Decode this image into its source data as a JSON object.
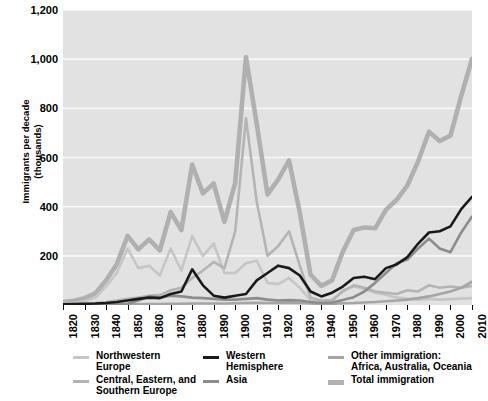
{
  "chart_data": {
    "type": "line",
    "title": "",
    "xlabel": "",
    "ylabel": "Immigrants per decade\n(thousands)",
    "xlim": [
      1820,
      2010
    ],
    "ylim": [
      0,
      1200
    ],
    "yticks": [
      "1,200",
      "1,000",
      "800",
      "600",
      "400",
      "200"
    ],
    "ytick_values": [
      1200,
      1000,
      800,
      600,
      400,
      200
    ],
    "xticks": [
      "1820",
      "1830",
      "1840",
      "1850",
      "1860",
      "1870",
      "1880",
      "1890",
      "1900",
      "1910",
      "1920",
      "1930",
      "1940",
      "1950",
      "1960",
      "1970",
      "1980",
      "1990",
      "2000",
      "2010"
    ],
    "grid": "horizontal",
    "legend_position": "bottom",
    "x": [
      1820,
      1825,
      1830,
      1835,
      1840,
      1845,
      1850,
      1855,
      1860,
      1865,
      1870,
      1875,
      1880,
      1885,
      1890,
      1895,
      1900,
      1905,
      1910,
      1915,
      1920,
      1925,
      1930,
      1935,
      1940,
      1945,
      1950,
      1955,
      1960,
      1965,
      1970,
      1975,
      1980,
      1985,
      1990,
      1995,
      2000,
      2005,
      2010
    ],
    "series": [
      {
        "name": "Northwestern Europe",
        "color": "#c6c6c6",
        "width": 2.6,
        "values": [
          5,
          8,
          15,
          30,
          75,
          130,
          230,
          150,
          160,
          120,
          230,
          140,
          280,
          200,
          250,
          130,
          130,
          170,
          180,
          90,
          85,
          110,
          70,
          20,
          12,
          15,
          60,
          75,
          65,
          50,
          42,
          30,
          25,
          22,
          25,
          22,
          24,
          26,
          28
        ]
      },
      {
        "name": "Central, Eastern, and Southern Europe",
        "color": "#b4b4b4",
        "width": 2.6,
        "values": [
          2,
          3,
          5,
          8,
          12,
          18,
          25,
          30,
          38,
          40,
          60,
          70,
          110,
          140,
          175,
          150,
          300,
          760,
          420,
          200,
          240,
          300,
          160,
          30,
          18,
          20,
          55,
          80,
          70,
          55,
          50,
          45,
          60,
          55,
          80,
          70,
          75,
          70,
          78
        ]
      },
      {
        "name": "Western Hemisphere",
        "color": "#1a1a1a",
        "width": 2.6,
        "values": [
          3,
          4,
          5,
          6,
          8,
          12,
          18,
          25,
          30,
          28,
          45,
          55,
          145,
          80,
          38,
          30,
          38,
          45,
          100,
          130,
          160,
          150,
          120,
          55,
          35,
          50,
          75,
          110,
          115,
          105,
          150,
          165,
          195,
          250,
          295,
          300,
          320,
          390,
          440
        ]
      },
      {
        "name": "Asia",
        "color": "#8c8c8c",
        "width": 2.6,
        "values": [
          1,
          1,
          2,
          2,
          3,
          4,
          5,
          18,
          35,
          30,
          38,
          35,
          30,
          28,
          25,
          22,
          22,
          25,
          28,
          22,
          18,
          20,
          18,
          12,
          8,
          10,
          20,
          32,
          55,
          90,
          130,
          170,
          185,
          230,
          270,
          230,
          215,
          295,
          360
        ]
      },
      {
        "name": "Other immigration: Africa, Australia, Oceania",
        "color": "#a5a5a5",
        "width": 2.6,
        "values": [
          1,
          1,
          1,
          1,
          2,
          2,
          3,
          3,
          4,
          4,
          5,
          5,
          6,
          6,
          6,
          6,
          7,
          8,
          9,
          8,
          8,
          8,
          8,
          6,
          5,
          5,
          7,
          8,
          10,
          12,
          15,
          18,
          22,
          28,
          35,
          45,
          55,
          70,
          95
        ]
      },
      {
        "name": "Total immigration",
        "color": "#b0b0b0",
        "width": 4.6,
        "values": [
          12,
          17,
          28,
          47,
          100,
          166,
          281,
          226,
          267,
          222,
          378,
          305,
          571,
          454,
          494,
          338,
          497,
          1008,
          737,
          450,
          511,
          588,
          376,
          123,
          78,
          100,
          217,
          305,
          315,
          312,
          387,
          428,
          487,
          585,
          705,
          667,
          689,
          851,
          1001
        ]
      }
    ]
  },
  "legend": {
    "columns": [
      {
        "items": [
          {
            "label": "Northwestern\nEurope",
            "color": "#c6c6c6",
            "thickness": 3,
            "name": "legend-northwestern-europe"
          },
          {
            "label": "Central, Eastern, and\nSouthern Europe",
            "color": "#b4b4b4",
            "thickness": 3,
            "name": "legend-central-eastern-southern-europe"
          }
        ]
      },
      {
        "items": [
          {
            "label": "Western\nHemisphere",
            "color": "#1a1a1a",
            "thickness": 3.4,
            "name": "legend-western-hemisphere"
          },
          {
            "label": "Asia",
            "color": "#8c8c8c",
            "thickness": 3,
            "name": "legend-asia"
          }
        ]
      },
      {
        "items": [
          {
            "label": "Other immigration:\nAfrica, Australia, Oceania",
            "color": "#a5a5a5",
            "thickness": 3,
            "name": "legend-other-immigration"
          },
          {
            "label": "Total immigration",
            "color": "#b0b0b0",
            "thickness": 5,
            "name": "legend-total-immigration"
          }
        ]
      }
    ]
  },
  "style": {
    "plot_background": "#e2e2e2",
    "grid_color": "#f7f7f7",
    "page_background": "#ffffff",
    "text_color": "#000000"
  }
}
